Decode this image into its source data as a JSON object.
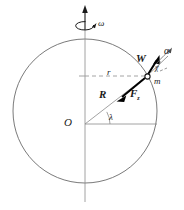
{
  "figure": {
    "stroke_color": "#4a4a4a",
    "vector_color": "#000000",
    "dash_color": "#888888"
  },
  "labels": {
    "omega": "ω",
    "alpha": "α",
    "weight_vector": "W",
    "chi_angle": "χ",
    "particle_mass": "m",
    "radius_small": "r",
    "radius_big": "R",
    "force_symbol": "F",
    "force_subscript": "z",
    "latitude_angle": "λ",
    "origin": "O"
  },
  "geometry": {
    "circle_center_x": 85,
    "circle_center_y": 111,
    "circle_radius": 72,
    "point_m_x": 147,
    "point_m_y": 76,
    "latitude_degrees": 29,
    "axis_top_y": 8,
    "axis_bottom_y": 202
  }
}
